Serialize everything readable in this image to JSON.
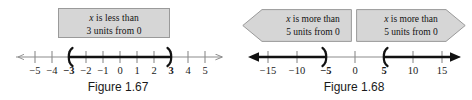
{
  "figures": [
    {
      "id": "figure-left",
      "caption": "Figure 1.67",
      "callout": {
        "line1_var": "x",
        "line1_rest": " is less than",
        "line2": "3 units from 0"
      },
      "axis": {
        "ticks": [
          "−5",
          "−4",
          "−3",
          "−2",
          "−1",
          "0",
          "1",
          "2",
          "3",
          "4",
          "5"
        ],
        "bold_ticks": [
          "−3",
          "3"
        ],
        "interval": {
          "type": "open-segment",
          "left_endpoint": -3,
          "right_endpoint": 3,
          "left_bracket": "(",
          "right_bracket": ")"
        }
      }
    },
    {
      "id": "figure-right",
      "caption": "Figure 1.68",
      "banners": [
        {
          "id": "banner-left",
          "direction": "left",
          "line1_var": "x",
          "line1_rest": " is more than",
          "line2": "5 units from 0"
        },
        {
          "id": "banner-right",
          "direction": "right",
          "line1_var": "x",
          "line1_rest": " is more than",
          "line2": "5 units from 0"
        }
      ],
      "axis": {
        "ticks": [
          "−15",
          "−10",
          "−5",
          "0",
          "5",
          "10",
          "15"
        ],
        "bold_ticks": [
          "−5",
          "5"
        ],
        "intervals": [
          {
            "type": "open-ray-left",
            "endpoint": -5,
            "bracket": ")"
          },
          {
            "type": "open-ray-right",
            "endpoint": 5,
            "bracket": "("
          }
        ]
      }
    }
  ],
  "colors": {
    "callout_fill": "#d6d6d6",
    "callout_border": "#9a9a9a",
    "banner_fill": "#d6d6d6",
    "banner_border": "#9a9a9a",
    "axis_line": "#8c8c8c",
    "highlight_line": "#111111",
    "text": "#1a1a1a"
  }
}
